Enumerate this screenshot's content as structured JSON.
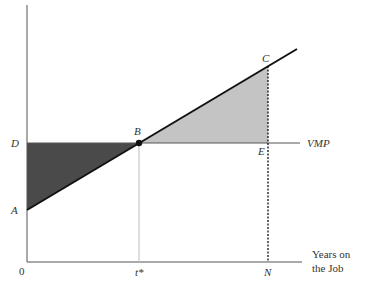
{
  "diagram": {
    "type": "economics-wage-profile",
    "axes": {
      "x_title_line1": "Years on",
      "x_title_line2": "the Job",
      "origin_label": "0",
      "x_ticks": [
        "t*",
        "N"
      ]
    },
    "points": {
      "A": "A",
      "B": "B",
      "C": "C",
      "D": "D",
      "E": "E"
    },
    "lines": {
      "vmp_label": "VMP"
    },
    "colors": {
      "dark_region": "#4a4a4a",
      "light_region": "#c4c4c4",
      "line": "#111111",
      "axis": "#555555",
      "guide": "#bbbbbb"
    }
  }
}
